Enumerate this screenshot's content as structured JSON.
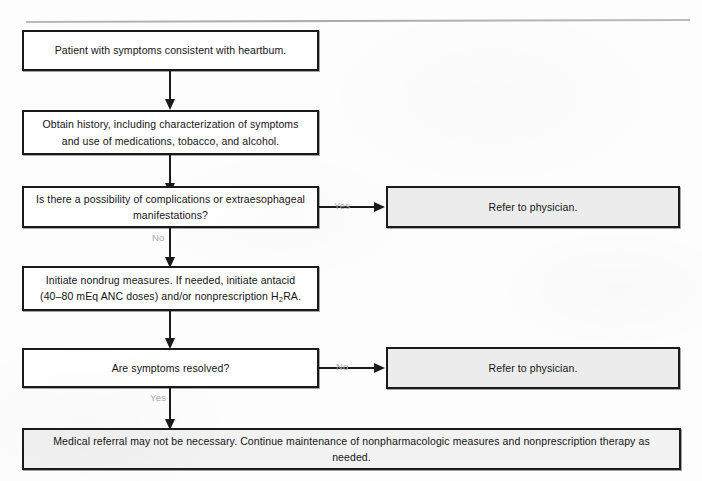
{
  "figure": {
    "top_rule": "horizontal-rule"
  },
  "nodes": {
    "start": "Patient with symptoms consistent with heartbum.",
    "history": "Obtain history, including characterization of symptoms and use of medications, tobacco, and alcohol.",
    "decision_complications": "Is there a possibility of complications or extraesophageal manifestations?",
    "refer_1": "Refer to physician.",
    "treatment": {
      "line1": "Initiate nondrug measures. If needed, initiate antacid",
      "line2_pre": "(40–80 mEq ANC doses) and/or nonprescription H",
      "line2_sub": "2",
      "line2_post": "RA."
    },
    "decision_resolved": "Are symptoms resolved?",
    "refer_2": "Refer to physician.",
    "outcome": "Medical referral may not be necessary. Continue maintenance of nonpharmacologic measures and nonprescription therapy as needed."
  },
  "branches": {
    "complications_yes": "Yes",
    "complications_no": "No",
    "resolved_no": "No",
    "resolved_yes": "Yes"
  },
  "colors": {
    "stroke": "#1a1a1a",
    "box_fill": "#ffffff",
    "shaded_fill": "#ececec",
    "bottom_fill": "#f2f2f2",
    "branch_label": "#a7a7a7",
    "rule": "#b3b3b3",
    "page_background": "#fdfdfd"
  }
}
